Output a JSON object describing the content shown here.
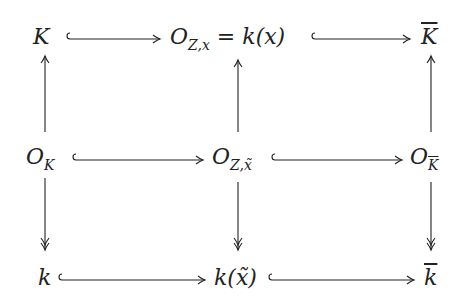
{
  "diagram": {
    "type": "commutative-diagram",
    "nodes": {
      "top_left": {
        "main": "K",
        "sub": ""
      },
      "top_mid": {
        "main": "O",
        "sub": "Z,x",
        "rest": " = k(x)"
      },
      "top_right": {
        "main": "K",
        "overline": true
      },
      "mid_left": {
        "main": "O",
        "sub": "K"
      },
      "mid_mid": {
        "main": "O",
        "sub": "Z,x̃"
      },
      "mid_right": {
        "main": "O",
        "sub": "K",
        "sub_overline": true
      },
      "bot_left": {
        "main": "k"
      },
      "bot_mid": {
        "main": "k(x̃)"
      },
      "bot_right": {
        "main": "k",
        "overline": true
      }
    },
    "edges": [
      {
        "from": "top_left",
        "to": "top_mid",
        "style": "hook-injection"
      },
      {
        "from": "top_mid",
        "to": "top_right",
        "style": "hook-injection"
      },
      {
        "from": "mid_left",
        "to": "mid_mid",
        "style": "hook-injection"
      },
      {
        "from": "mid_mid",
        "to": "mid_right",
        "style": "hook-injection"
      },
      {
        "from": "bot_left",
        "to": "bot_mid",
        "style": "hook-injection"
      },
      {
        "from": "bot_mid",
        "to": "bot_right",
        "style": "hook-injection"
      },
      {
        "from": "mid_left",
        "to": "top_left",
        "style": "arrow"
      },
      {
        "from": "mid_mid",
        "to": "top_mid",
        "style": "arrow"
      },
      {
        "from": "mid_right",
        "to": "top_right",
        "style": "arrow"
      },
      {
        "from": "mid_left",
        "to": "bot_left",
        "style": "surjection"
      },
      {
        "from": "mid_mid",
        "to": "bot_mid",
        "style": "surjection"
      },
      {
        "from": "mid_right",
        "to": "bot_right",
        "style": "surjection"
      }
    ]
  }
}
